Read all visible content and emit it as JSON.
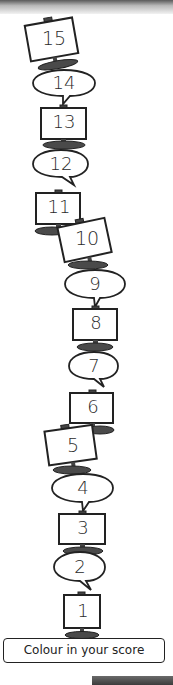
{
  "worksheet": {
    "title_label": "Colour in your score",
    "tower": [
      {
        "value": "15",
        "shape": "monitor",
        "tilt": -10
      },
      {
        "value": "14",
        "shape": "speech-bubble"
      },
      {
        "value": "13",
        "shape": "monitor",
        "tilt": 0
      },
      {
        "value": "12",
        "shape": "speech-bubble"
      },
      {
        "value": "11",
        "shape": "monitor",
        "tilt": 0
      },
      {
        "value": "10",
        "shape": "monitor",
        "tilt": -12
      },
      {
        "value": "9",
        "shape": "speech-bubble"
      },
      {
        "value": "8",
        "shape": "monitor",
        "tilt": 0
      },
      {
        "value": "7",
        "shape": "speech-bubble"
      },
      {
        "value": "6",
        "shape": "monitor",
        "tilt": 0
      },
      {
        "value": "5",
        "shape": "monitor",
        "tilt": -8
      },
      {
        "value": "4",
        "shape": "speech-bubble"
      },
      {
        "value": "3",
        "shape": "monitor",
        "tilt": 0
      },
      {
        "value": "2",
        "shape": "speech-bubble"
      },
      {
        "value": "1",
        "shape": "monitor",
        "tilt": 0
      }
    ]
  },
  "colors": {
    "outline": "#222222",
    "monitor_base": "#4a4a4a",
    "fill": "#ffffff"
  }
}
